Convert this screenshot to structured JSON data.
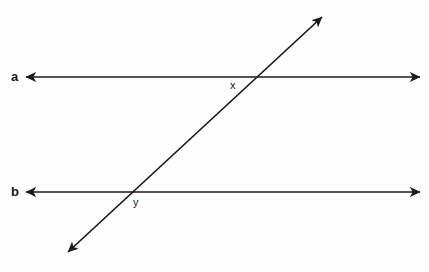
{
  "diagram": {
    "background_color": "#fdfdfd",
    "stroke_color": "#1a1a1a",
    "width": 429,
    "height": 272,
    "labels": {
      "line_a": "a",
      "line_b": "b",
      "vertex_upper": "x",
      "vertex_lower": "y"
    },
    "lines": [
      {
        "name": "line-a",
        "kind": "horizontal",
        "label": "a",
        "arrowheads": "both",
        "x1": 26,
        "y1": 77,
        "x2": 420,
        "y2": 77
      },
      {
        "name": "line-b",
        "kind": "horizontal",
        "label": "b",
        "arrowheads": "both",
        "x1": 26,
        "y1": 192,
        "x2": 420,
        "y2": 192
      },
      {
        "name": "transversal",
        "kind": "diagonal",
        "label": "",
        "arrowheads": "both",
        "x1": 68,
        "y1": 252,
        "x2": 322,
        "y2": 17
      }
    ],
    "intersections": [
      {
        "name": "vertex-x",
        "label": "x",
        "on_line": "a",
        "x": 256,
        "y": 77
      },
      {
        "name": "vertex-y",
        "label": "y",
        "on_line": "b",
        "x": 128,
        "y": 192
      }
    ]
  }
}
